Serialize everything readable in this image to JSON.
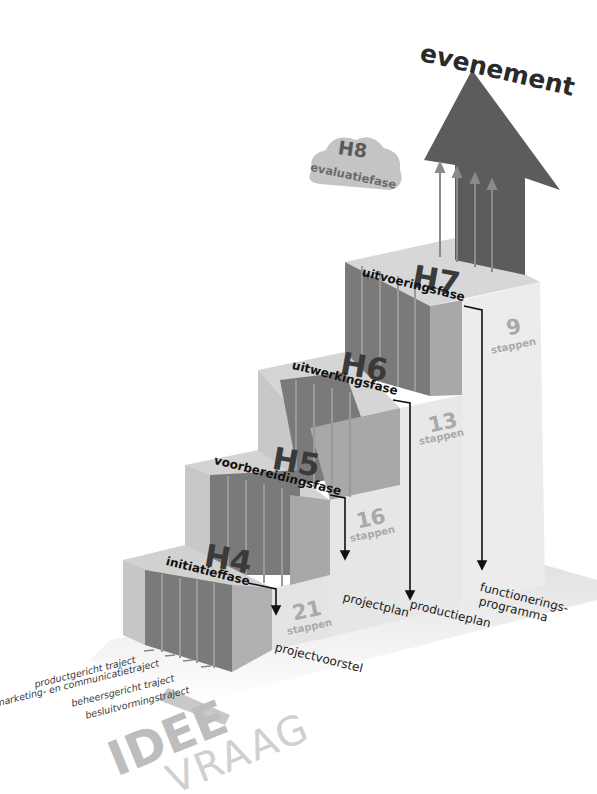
{
  "diagram": {
    "title": "evenement",
    "evaluation": {
      "code": "H8",
      "label": "evaluatiefase"
    },
    "phases": [
      {
        "code": "H4",
        "label": "initiatieffase",
        "steps_count": "21",
        "steps_word": "stappen",
        "deliverable": "projectvoorstel"
      },
      {
        "code": "H5",
        "label": "voorbereidingsfase",
        "steps_count": "16",
        "steps_word": "stappen",
        "deliverable": "projectplan"
      },
      {
        "code": "H6",
        "label": "uitwerkingsfase",
        "steps_count": "13",
        "steps_word": "stappen",
        "deliverable": "productieplan"
      },
      {
        "code": "H7",
        "label": "uitvoeringsfase",
        "steps_count": "9",
        "steps_word": "stappen",
        "deliverable_line1": "functionerings-",
        "deliverable_line2": "programma"
      }
    ],
    "tracks": [
      "productgericht traject",
      "marketing- en communicatietraject",
      "beheersgericht traject",
      "besluitvormingstraject"
    ],
    "start": {
      "line1": "IDEE",
      "line2": "VRAAG"
    },
    "colors": {
      "dark_track": "#6e6e6e",
      "light_block": "#e6e6e6",
      "mid_block": "#b8b8b8",
      "arrow": "#5c5c5c",
      "cloud": "#c4c4c4",
      "steps_text": "#a9a9a9"
    }
  }
}
